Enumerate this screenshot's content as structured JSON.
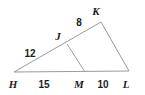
{
  "figure": {
    "type": "geometry-diagram",
    "shape": "triangle",
    "stroke_color": "#9a9a9a",
    "label_color": "#1c1c1c",
    "background_color": "#ffffff",
    "vertices": [
      {
        "id": "H",
        "label": "H",
        "x": 14,
        "y": 72,
        "label_x": 13,
        "label_y": 88
      },
      {
        "id": "K",
        "label": "K",
        "x": 101,
        "y": 22,
        "label_x": 96,
        "label_y": 15
      },
      {
        "id": "L",
        "label": "L",
        "x": 129,
        "y": 71,
        "label_x": 126,
        "label_y": 88
      },
      {
        "id": "J",
        "label": "J",
        "x": 67,
        "y": 44,
        "label_x": 58,
        "label_y": 40
      },
      {
        "id": "M",
        "label": "M",
        "x": 85,
        "y": 72,
        "label_x": 79,
        "label_y": 88
      }
    ],
    "segments": [
      {
        "id": "HK",
        "from": "H",
        "to": "K"
      },
      {
        "id": "KL",
        "from": "K",
        "to": "L"
      },
      {
        "id": "HL",
        "from": "H",
        "to": "L"
      },
      {
        "id": "JM",
        "from": "J",
        "to": "M"
      }
    ],
    "measures": [
      {
        "id": "HJ",
        "segment": "HJ",
        "value": "12",
        "x": 30,
        "y": 57
      },
      {
        "id": "JK",
        "segment": "JK",
        "value": "8",
        "x": 79,
        "y": 26
      },
      {
        "id": "HM",
        "segment": "HM",
        "value": "15",
        "x": 44,
        "y": 88
      },
      {
        "id": "ML",
        "segment": "ML",
        "value": "10",
        "x": 103,
        "y": 88
      }
    ]
  }
}
